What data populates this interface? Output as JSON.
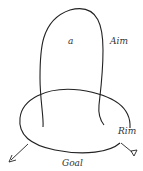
{
  "diagram": {
    "labels": {
      "inner": "a",
      "aim": "Aim",
      "rim": "Rim",
      "goal": "Goal"
    },
    "colors": {
      "stroke": "#222222",
      "text": "#333333",
      "background": "#ffffff"
    }
  }
}
